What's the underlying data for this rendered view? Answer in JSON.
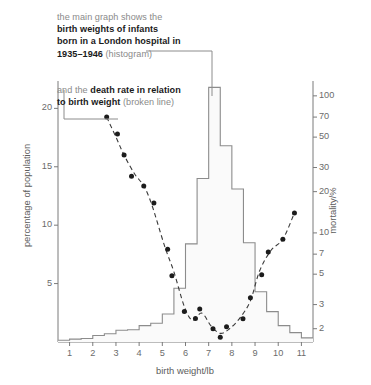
{
  "annotations": {
    "histogram_note": {
      "line1": "the main graph shows the",
      "line2": "birth weights of infants",
      "line3": "born in a London hospital in",
      "line4_bold": "1935–1946",
      "line4_rest": " (histogram)"
    },
    "deathrate_note": {
      "line1_lead": "and the ",
      "line1_bold": "death rate in relation",
      "line2_bold": "to birth weight",
      "line2_rest": " (broken line)"
    }
  },
  "chart_data": {
    "type": "bar",
    "title": "",
    "subtitle": "",
    "xlabel": "birth weight/lb",
    "ylabel": "percentage of population",
    "y2label": "mortality/%",
    "grid": false,
    "legend_position": "none",
    "xlim": [
      0.5,
      11.5
    ],
    "ylim": [
      0,
      22
    ],
    "y2_scale": "log",
    "y2lim": [
      1.6,
      120
    ],
    "x_ticks": [
      1,
      2,
      3,
      4,
      5,
      6,
      7,
      8,
      9,
      10,
      11
    ],
    "y_ticks": [
      5,
      10,
      15,
      20
    ],
    "y2_ticks": [
      2,
      3,
      5,
      7,
      10,
      20,
      30,
      50,
      70,
      100
    ],
    "series": [
      {
        "name": "birth weights of infants born in a London hospital in 1935-1946",
        "kind": "histogram",
        "unit": "percentage of population",
        "bin_edges": [
          0.5,
          1.0,
          1.5,
          2.0,
          2.5,
          3.0,
          3.5,
          4.0,
          4.5,
          5.0,
          5.5,
          6.0,
          6.5,
          7.0,
          7.5,
          8.0,
          8.5,
          9.0,
          9.5,
          10.0,
          10.5,
          11.0,
          11.5
        ],
        "values": [
          0.15,
          0.25,
          0.3,
          0.55,
          0.7,
          1.0,
          1.05,
          1.4,
          1.6,
          2.4,
          4.6,
          8.4,
          14.0,
          21.8,
          16.8,
          13.1,
          8.5,
          4.3,
          2.6,
          1.4,
          0.8,
          0.35
        ]
      },
      {
        "name": "death rate in relation to birth weight",
        "kind": "scatter+line",
        "unit": "mortality/%",
        "x": [
          2.6,
          3.0,
          3.35,
          3.8,
          4.2,
          4.55,
          5.1,
          5.5,
          5.95,
          6.3,
          6.7,
          7.1,
          7.5,
          7.9,
          8.35,
          8.8,
          9.2,
          9.7,
          10.2,
          10.7
        ],
        "y": [
          70,
          50,
          37,
          27,
          22,
          16,
          8.0,
          5.2,
          2.9,
          2.3,
          2.6,
          2.1,
          1.85,
          2.0,
          2.4,
          3.2,
          5.3,
          7.5,
          9.0,
          14.0
        ]
      }
    ]
  }
}
